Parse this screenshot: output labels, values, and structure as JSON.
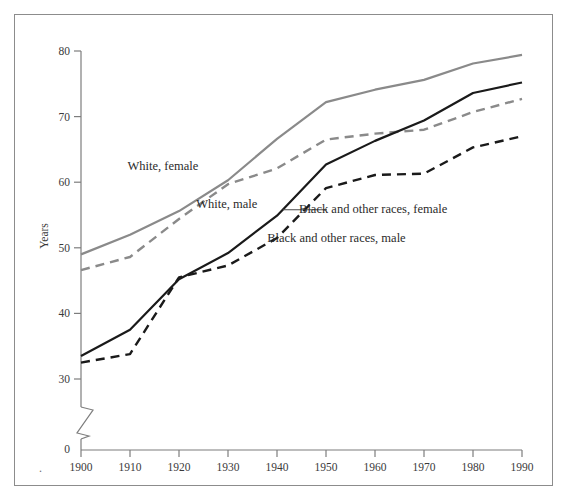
{
  "figure": {
    "ylabel": "Years",
    "zero_label": "0",
    "background_color": "#ffffff",
    "frame_color": "#8c8c8c",
    "axis_color": "#7d7d7d",
    "white_series_color": "#8a8a8a",
    "black_series_color": "#1a1a1a",
    "leader_line_color": "#4a4a4a"
  },
  "chart_data": {
    "type": "line",
    "title": "",
    "subtitle": "",
    "xlabel": "",
    "ylabel": "Years",
    "x": [
      1900,
      1910,
      1920,
      1930,
      1940,
      1950,
      1960,
      1970,
      1980,
      1990
    ],
    "xticklabels": [
      "1900",
      "1910",
      "1920",
      "1930",
      "1940",
      "1950",
      "1960",
      "1970",
      "1980",
      "1990"
    ],
    "yticks": [
      30,
      40,
      50,
      60,
      70,
      80
    ],
    "yticklabels": [
      "30",
      "40",
      "50",
      "60",
      "70",
      "80"
    ],
    "ylim": [
      30,
      80
    ],
    "xlim": [
      1900,
      1990
    ],
    "axis_break": true,
    "axis_break_note": "y-axis broken between 0 and 30",
    "grid": false,
    "legend_position": "inline-annotations",
    "series": [
      {
        "name": "White, female",
        "style": "solid",
        "color": "#8a8a8a",
        "values": [
          49.0,
          52.0,
          55.6,
          60.3,
          66.6,
          72.2,
          74.1,
          75.6,
          78.1,
          79.4
        ]
      },
      {
        "name": "White, male",
        "style": "dashed",
        "color": "#8a8a8a",
        "values": [
          46.6,
          48.6,
          54.4,
          59.7,
          62.1,
          66.5,
          67.4,
          68.0,
          70.7,
          72.7
        ]
      },
      {
        "name": "Black and other races, female",
        "style": "solid",
        "color": "#1a1a1a",
        "values": [
          33.5,
          37.5,
          45.2,
          49.2,
          54.9,
          62.7,
          66.3,
          69.4,
          73.6,
          75.2
        ]
      },
      {
        "name": "Black and other races, male",
        "style": "dashed",
        "color": "#1a1a1a",
        "values": [
          32.5,
          33.8,
          45.5,
          47.3,
          51.5,
          59.1,
          61.1,
          61.3,
          65.3,
          67.0
        ]
      }
    ],
    "annotations": [
      {
        "text": "White, female",
        "x": 1909.5,
        "y": 62.3
      },
      {
        "text": "White, male",
        "x": 1923.5,
        "y": 56.6
      },
      {
        "text": "Black and other races, female",
        "x": 1944.5,
        "y": 55.8
      },
      {
        "text": "Black and other races, male",
        "x": 1938.0,
        "y": 51.3
      }
    ]
  }
}
